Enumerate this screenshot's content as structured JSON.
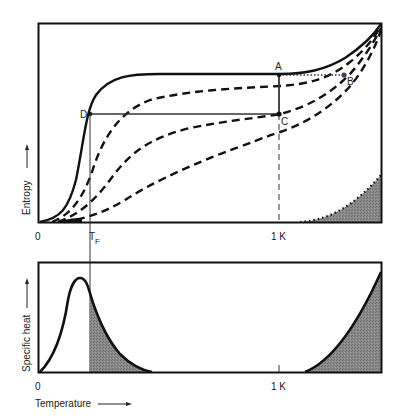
{
  "top_panel": {
    "y_label": "Entropy",
    "x_tick_zero": "0",
    "x_tick_tf": "T",
    "x_tick_tf_sub": "F",
    "x_tick_1k": "1 K",
    "points": {
      "A": "A",
      "B": "B",
      "C": "C",
      "D": "D"
    }
  },
  "bottom_panel": {
    "y_label": "Specific heat",
    "x_tick_zero": "0",
    "x_tick_1k": "1 K",
    "x_label": "Temperature"
  },
  "colors": {
    "line": "#111111",
    "shade": "#7a7a7a",
    "background": "#ffffff"
  }
}
